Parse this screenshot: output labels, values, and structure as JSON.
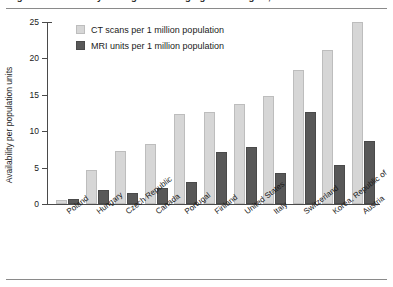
{
  "figure": {
    "title_clipped": "Figure 3: Availability of diagnostic imaging technologies, selected countries",
    "ylabel": "Availability per population units"
  },
  "legend": {
    "position": "upper-left-inside",
    "entries": [
      {
        "label": "CT scans per 1 million population",
        "color": "#d6d6d6",
        "icon": "legend-swatch-ct"
      },
      {
        "label": "MRI units per 1 million population",
        "color": "#585858",
        "icon": "legend-swatch-mri"
      }
    ]
  },
  "yaxis": {
    "ticks": [
      "0",
      "5",
      "10",
      "15",
      "20",
      "25"
    ],
    "min": 0,
    "max": 25
  },
  "chart_data": {
    "type": "bar",
    "title": "Availability of diagnostic imaging technologies",
    "xlabel": "",
    "ylabel": "Availability per population units",
    "ylim": [
      0,
      25
    ],
    "yticks": [
      0,
      5,
      10,
      15,
      20,
      25
    ],
    "grid": false,
    "legend_position": "upper left",
    "categories": [
      "Poland",
      "Hungary",
      "Czech Republic",
      "Canada",
      "Portugal",
      "Finland",
      "United States",
      "Italy",
      "Switzerland",
      "Korea, Republic of",
      "Austria"
    ],
    "series": [
      {
        "name": "CT scans per 1 million population",
        "color": "#d6d6d6",
        "values": [
          0.6,
          4.7,
          7.3,
          8.3,
          12.4,
          12.7,
          13.8,
          14.9,
          18.4,
          21.2,
          25.0
        ]
      },
      {
        "name": "MRI units per 1 million population",
        "color": "#585858",
        "values": [
          0.7,
          1.9,
          1.5,
          2.2,
          3.0,
          7.2,
          7.8,
          4.2,
          12.6,
          5.3,
          8.6
        ]
      }
    ]
  }
}
